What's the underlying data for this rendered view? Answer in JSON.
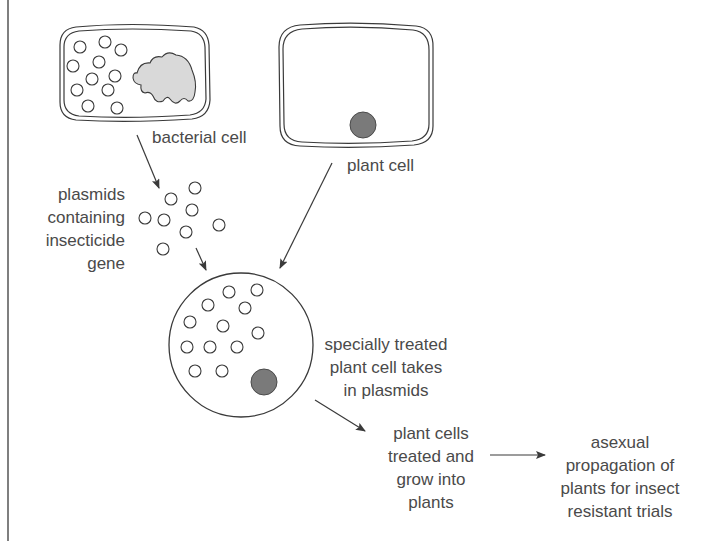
{
  "diagram": {
    "colors": {
      "line": "#3a3a3a",
      "text": "#4a4a4a",
      "bacterial_dna": "#d9d9d9",
      "nucleus": "#7a7a7a",
      "background": "#ffffff"
    },
    "nodes": {
      "bacterial_cell": {
        "label": "bacterial cell",
        "plasmid_count": 11
      },
      "plant_cell": {
        "label": "plant cell"
      },
      "plasmids": {
        "label": "plasmids\ncontaining\ninsecticide\ngene",
        "plasmid_count": 8
      },
      "treated_cell": {
        "label": "specially treated\nplant cell takes\nin plasmids",
        "plasmid_count": 12
      },
      "grow_plants": {
        "label": "plant cells\ntreated and\ngrow into\nplants"
      },
      "propagation": {
        "label": "asexual\npropagation of\nplants for insect\nresistant trials"
      }
    },
    "edges": [
      {
        "from": "bacterial_cell",
        "to": "plasmids"
      },
      {
        "from": "plasmids",
        "to": "treated_cell"
      },
      {
        "from": "plant_cell",
        "to": "treated_cell"
      },
      {
        "from": "treated_cell",
        "to": "grow_plants"
      },
      {
        "from": "grow_plants",
        "to": "propagation"
      }
    ]
  }
}
